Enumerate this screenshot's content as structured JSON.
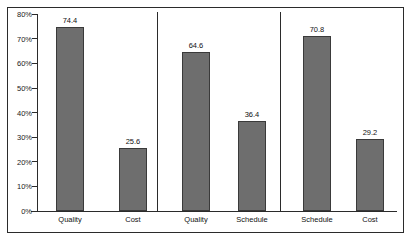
{
  "chart_data": {
    "type": "bar",
    "title": "",
    "subtitle": "",
    "xlabel": "",
    "ylabel": "",
    "ylim": [
      0,
      80
    ],
    "grid": false,
    "legend": "none",
    "y_tick_labels": [
      "80%",
      "70%",
      "60%",
      "50%",
      "40%",
      "30%",
      "20%",
      "10%",
      "0%"
    ],
    "y_tick_values": [
      80,
      70,
      60,
      50,
      40,
      30,
      20,
      10,
      0
    ],
    "panels": [
      {
        "name": "panel-1",
        "categories": [
          "Quality",
          "Cost"
        ],
        "values": [
          74.4,
          25.6
        ],
        "value_labels": [
          "74.4",
          "25.6"
        ]
      },
      {
        "name": "panel-2",
        "categories": [
          "Quality",
          "Schedule"
        ],
        "values": [
          64.6,
          36.4
        ],
        "value_labels": [
          "64.6",
          "36.4"
        ]
      },
      {
        "name": "panel-3",
        "categories": [
          "Schedule",
          "Cost"
        ],
        "values": [
          70.8,
          29.2
        ],
        "value_labels": [
          "70.8",
          "29.2"
        ]
      }
    ],
    "colors": {
      "bar_fill": "#6e6e6e",
      "bar_border": "#3a3a3a",
      "axis": "#2b2b2b",
      "text": "#111111",
      "background": "#ffffff"
    }
  }
}
